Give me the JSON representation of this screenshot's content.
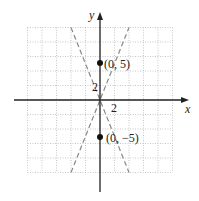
{
  "chart_data": {
    "type": "scatter",
    "title": "",
    "xlabel": "x",
    "ylabel": "y",
    "xlim": [
      -10,
      10
    ],
    "ylim": [
      -10,
      10
    ],
    "grid": true,
    "grid_spacing": 2,
    "tick_labels": {
      "x": "2",
      "y": "2"
    },
    "points": [
      {
        "x": 0,
        "y": 5,
        "label": "(0, 5)"
      },
      {
        "x": 0,
        "y": -5,
        "label": "(0, −5)"
      }
    ],
    "dashed_lines": [
      {
        "name": "asymptote-positive",
        "equation": "y = (5/2)x",
        "from": [
          -4,
          -10
        ],
        "to": [
          4,
          10
        ]
      },
      {
        "name": "asymptote-negative",
        "equation": "y = -(5/2)x",
        "from": [
          -4,
          10
        ],
        "to": [
          4,
          -10
        ]
      }
    ]
  },
  "labels": {
    "x_axis": "x",
    "y_axis": "y",
    "x_tick": "2",
    "y_tick": "2",
    "point_top": "(0, 5)",
    "point_bottom": "(0, −5)"
  },
  "colors": {
    "axis": "#222222",
    "grid": "#b8b8b8",
    "dashed": "#888888",
    "point": "#111111"
  }
}
